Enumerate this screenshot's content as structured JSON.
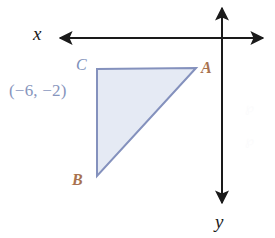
{
  "figure": {
    "axes": {
      "x_label": "x",
      "y_label": "y",
      "x_axis_y_px": 38,
      "x_axis_from_px": 58,
      "x_axis_to_px": 266,
      "y_axis_x_px": 222,
      "y_axis_from_px": 5,
      "y_axis_to_px": 206,
      "arrowheads": [
        "x-left",
        "x-right",
        "y-up",
        "y-down"
      ],
      "color": "#1a1a1a",
      "stroke_width": 2
    },
    "triangle": {
      "vertices": [
        {
          "name": "A",
          "x_px": 196,
          "y_px": 68
        },
        {
          "name": "B",
          "x_px": 97,
          "y_px": 176
        },
        {
          "name": "C",
          "x_px": 97,
          "y_px": 69
        }
      ],
      "fill_color": "#e5eaf4",
      "stroke_color": "#8491bd",
      "stroke_width": 2
    },
    "vertex_labels": [
      {
        "key": "A",
        "text": "A",
        "color": "#a9724f"
      },
      {
        "key": "B",
        "text": "B",
        "color": "#a9724f"
      },
      {
        "key": "C",
        "text": "C",
        "color": "#7e90ba"
      }
    ],
    "coordinate_label": {
      "text": "(−6, −2)",
      "color": "#8795bd",
      "refers_to_vertex": "C"
    },
    "watermarks": [
      {
        "text": "℘",
        "opacity": "faint"
      },
      {
        "text": "℘",
        "opacity": "faint"
      }
    ]
  },
  "colors": {
    "page_background": "#ffffff",
    "axis": "#1a1a1a",
    "triangle_fill": "#e5eaf4",
    "triangle_stroke": "#8491bd",
    "vertex_orange": "#a9724f",
    "vertex_blue": "#7e90ba",
    "coord_blue": "#8795bd"
  }
}
